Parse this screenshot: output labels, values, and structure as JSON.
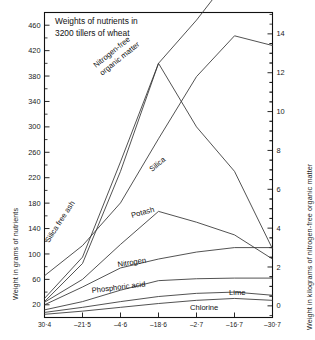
{
  "chart_data": {
    "type": "line",
    "title": "Weights of nutrients in\n3200 tillers of wheat",
    "xlabel": "",
    "ylabel": "Weight in grams of nutrients",
    "y2label": "Weight in kilograms of nitrogen-free organic matter",
    "grid": false,
    "legend_position": "inline-curve-labels",
    "categories": [
      "30·4",
      "21·5",
      "4·6",
      "18·6",
      "2·7",
      "16·7",
      "30·7"
    ],
    "x_tick_labels": [
      "30·4",
      "21·5",
      "4·6",
      "18·6",
      "2·7",
      "16·7",
      "30·7"
    ],
    "x_tick_prefix_dash": [
      false,
      true,
      true,
      true,
      true,
      true,
      true
    ],
    "ylim": [
      0,
      480
    ],
    "y_ticks": [
      20,
      60,
      100,
      140,
      180,
      220,
      260,
      300,
      340,
      380,
      420,
      460
    ],
    "y_tick_labels": [
      "20",
      "60",
      "100",
      "140",
      "180",
      "220",
      "260",
      "300",
      "340",
      "380",
      "420",
      "460"
    ],
    "y2lim": [
      -0.6,
      15.1
    ],
    "y2_ticks": [
      0,
      2,
      4,
      6,
      8,
      10,
      12,
      14
    ],
    "y2_tick_labels": [
      "0",
      "2",
      "4",
      "6",
      "8",
      "10",
      "12",
      "14"
    ],
    "series": [
      {
        "name": "Nitrogen-free organic matter",
        "label": "Nitrogen-free\norganic matter",
        "axis": "right",
        "values": [
          1.55,
          3.1,
          5.3,
          8.6,
          11.8,
          13.9,
          13.4
        ],
        "color": "#333333"
      },
      {
        "name": "Silica free ash",
        "label": "Silica free ash",
        "axis": "left",
        "values": [
          30,
          95,
          245,
          400,
          468,
          545,
          530
        ],
        "color": "#333333"
      },
      {
        "name": "Silica",
        "label": "Silica",
        "axis": "left",
        "values": [
          25,
          85,
          230,
          400,
          300,
          230,
          108
        ],
        "color": "#333333"
      },
      {
        "name": "Potash",
        "label": "Potash",
        "axis": "left",
        "values": [
          24,
          60,
          115,
          167,
          150,
          130,
          92
        ],
        "color": "#333333"
      },
      {
        "name": "Nitrogen",
        "label": "Nitrogen",
        "axis": "left",
        "values": [
          20,
          48,
          78,
          92,
          103,
          110,
          110
        ],
        "color": "#333333"
      },
      {
        "name": "Phosphoric acid",
        "label": "Phosphoric acid",
        "axis": "left",
        "values": [
          12,
          25,
          43,
          58,
          61,
          62,
          62
        ],
        "color": "#333333"
      },
      {
        "name": "Lime",
        "label": "Lime",
        "axis": "left",
        "values": [
          8,
          16,
          25,
          33,
          38,
          40,
          35
        ],
        "color": "#333333"
      },
      {
        "name": "Chlorine",
        "label": "Chlorine",
        "axis": "left",
        "values": [
          5,
          10,
          16,
          22,
          27,
          30,
          27
        ],
        "color": "#333333"
      }
    ]
  }
}
